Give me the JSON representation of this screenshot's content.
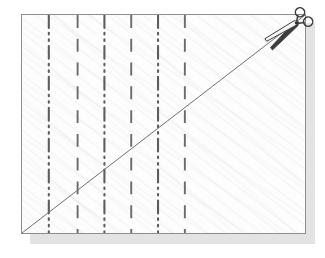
{
  "figure": {
    "background_color": "#ffffff",
    "sheet": {
      "fill_color": "#fdfdfd",
      "border_color": "#8d8d8d",
      "shadow_color": "#e3e3e3",
      "x": 21,
      "y": 14,
      "width": 285,
      "height": 220,
      "texture": "diagonal-paper-fibre"
    },
    "cut_line": {
      "label": "diagonal cut line",
      "color": "#6f6f6f",
      "width": 1,
      "from": {
        "x": 0,
        "y": 220
      },
      "to": {
        "x": 285,
        "y": 0
      }
    },
    "grid_lines": [
      {
        "id": 1,
        "x": 27,
        "style": "dash-dot-dot",
        "color": "#5d5d5d"
      },
      {
        "id": 2,
        "x": 56,
        "style": "dashed",
        "color": "#6a6a6a"
      },
      {
        "id": 3,
        "x": 83,
        "style": "dash-dot-dot",
        "color": "#5d5d5d"
      },
      {
        "id": 4,
        "x": 110,
        "style": "dashed",
        "color": "#6a6a6a"
      },
      {
        "id": 5,
        "x": 137,
        "style": "dash-dot-dot",
        "color": "#5d5d5d"
      },
      {
        "id": 6,
        "x": 164,
        "style": "dashed",
        "color": "#6a6a6a"
      }
    ],
    "scissors": {
      "icon": "scissors-icon",
      "label": "scissors cutting along the diagonal",
      "color": "#3a3a3a",
      "x": 268,
      "y": 10,
      "rotation_deg": -38
    }
  }
}
